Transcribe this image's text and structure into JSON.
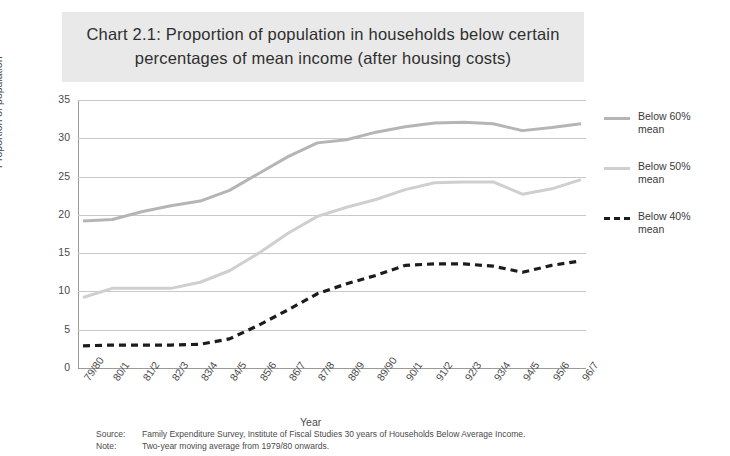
{
  "chart_data": {
    "type": "line",
    "title": "Chart 2.1: Proportion of population in households below certain percentages of mean income (after housing costs)",
    "xlabel": "Year",
    "ylabel": "Proportion of population",
    "ylim": [
      0,
      35
    ],
    "yticks": [
      0,
      5,
      10,
      15,
      20,
      25,
      30,
      35
    ],
    "grid": true,
    "legend_position": "right",
    "categories": [
      "79/80",
      "80/1",
      "81/2",
      "82/3",
      "83/4",
      "84/5",
      "85/6",
      "86/7",
      "87/8",
      "88/9",
      "89/90",
      "90/1",
      "91/2",
      "92/3",
      "93/4",
      "94/5",
      "95/6",
      "96/7"
    ],
    "series": [
      {
        "name": "Below 60% mean",
        "color": "#b5b5b5",
        "style": "solid",
        "values": [
          19.2,
          19.4,
          20.4,
          21.2,
          21.8,
          23.2,
          25.4,
          27.6,
          29.4,
          29.8,
          30.8,
          31.5,
          32.0,
          32.1,
          31.9,
          31.0,
          31.4,
          31.9
        ]
      },
      {
        "name": "Below 50% mean",
        "color": "#cfcfcf",
        "style": "solid",
        "values": [
          9.2,
          10.4,
          10.4,
          10.4,
          11.2,
          12.7,
          15.0,
          17.6,
          19.8,
          21.0,
          22.0,
          23.3,
          24.2,
          24.3,
          24.3,
          22.7,
          23.4,
          24.6
        ]
      },
      {
        "name": "Below 40% mean",
        "color": "#1c1c1c",
        "style": "dashed",
        "values": [
          2.9,
          3.0,
          3.0,
          3.0,
          3.1,
          3.8,
          5.6,
          7.6,
          9.7,
          11.0,
          12.1,
          13.4,
          13.6,
          13.6,
          13.3,
          12.5,
          13.4,
          14.0
        ]
      }
    ]
  },
  "legend": [
    {
      "label": "Below 60%\nmean",
      "color": "#b5b5b5",
      "style": "solid"
    },
    {
      "label": "Below 50%\nmean",
      "color": "#cfcfcf",
      "style": "solid"
    },
    {
      "label": "Below 40%\nmean",
      "color": "#1c1c1c",
      "style": "dashed"
    }
  ],
  "footnotes": [
    {
      "key": "Source:",
      "text": "Family Expenditure Survey, Institute of Fiscal Studies 30 years of Households Below Average Income."
    },
    {
      "key": "Note:",
      "text": "Two-year moving average from 1979/80 onwards."
    }
  ]
}
